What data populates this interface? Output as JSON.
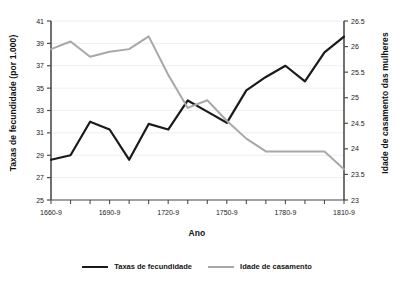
{
  "chart_data": {
    "type": "line",
    "title": "",
    "xlabel": "Ano",
    "ylabel": "Taxas de fecundidade (por 1.000)",
    "ylabel_right": "Idade de casamento das mulheres",
    "grid": true,
    "legend_position": "bottom",
    "categories": [
      "1660-9",
      "1670-9",
      "1680-9",
      "1690-9",
      "1700-9",
      "1710-9",
      "1720-9",
      "1730-9",
      "1740-9",
      "1750-9",
      "1760-9",
      "1770-9",
      "1780-9",
      "1790-9",
      "1800-9",
      "1810-9"
    ],
    "xtick_labels": [
      "1660-9",
      "1690-9",
      "1720-9",
      "1750-9",
      "1780-9",
      "1810-9"
    ],
    "xtick_label_indices": [
      0,
      3,
      6,
      9,
      12,
      15
    ],
    "ylim": [
      25,
      41
    ],
    "ytick_values": [
      25,
      27,
      29,
      31,
      33,
      35,
      37,
      39,
      41
    ],
    "ylim_right": [
      23,
      26.5
    ],
    "ytick_values_right": [
      23,
      23.5,
      24,
      24.5,
      25,
      25.5,
      26,
      26.5
    ],
    "series": [
      {
        "name": "Taxas de fecundidade",
        "axis": "left",
        "color": "#1a1a1a",
        "values": [
          28.6,
          29.0,
          32.0,
          31.3,
          28.6,
          31.8,
          31.3,
          33.9,
          32.9,
          31.9,
          34.8,
          36.0,
          37.0,
          35.6,
          38.2,
          39.6
        ]
      },
      {
        "name": "Idade de casamento",
        "axis": "right",
        "color": "#a8a8a8",
        "values": [
          25.95,
          26.1,
          25.8,
          25.9,
          25.95,
          26.2,
          25.45,
          24.8,
          24.95,
          24.55,
          24.2,
          23.95,
          23.95,
          23.95,
          23.95,
          23.6
        ]
      }
    ]
  },
  "legend": {
    "items": [
      {
        "label": "Taxas de fecundidade"
      },
      {
        "label": "Idade de casamento"
      }
    ]
  }
}
